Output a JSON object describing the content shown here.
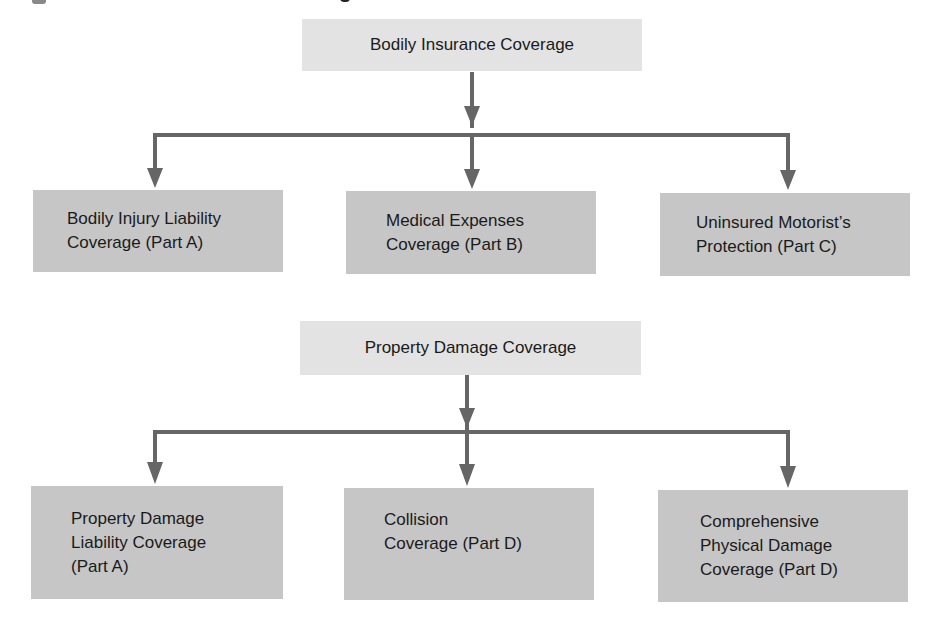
{
  "diagram": {
    "groups": [
      {
        "root": {
          "label": "Bodily Insurance Coverage"
        },
        "children": [
          {
            "label": "Bodily Injury Liability\nCoverage (Part A)"
          },
          {
            "label": "Medical Expenses\nCoverage (Part B)"
          },
          {
            "label": "Uninsured Motorist’s\nProtection (Part C)"
          }
        ]
      },
      {
        "root": {
          "label": "Property Damage Coverage"
        },
        "children": [
          {
            "label": "Property Damage\nLiability Coverage\n(Part A)"
          },
          {
            "label": "Collision\nCoverage (Part D)"
          },
          {
            "label": "Comprehensive\nPhysical Damage\nCoverage (Part D)"
          }
        ]
      }
    ],
    "colors": {
      "root_fill": "#e3e3e3",
      "child_fill": "#c6c6c6",
      "connector": "#666666"
    }
  }
}
